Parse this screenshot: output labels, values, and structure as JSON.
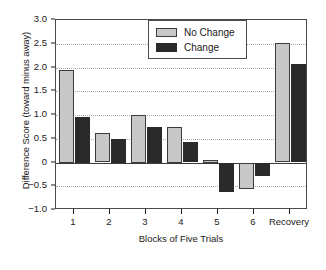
{
  "chart_data": {
    "type": "bar",
    "title": "",
    "xlabel": "Blocks of Five Trials",
    "ylabel": "Difference Score (toward minus away)",
    "categories": [
      "1",
      "2",
      "3",
      "4",
      "5",
      "6",
      "Recovery"
    ],
    "series": [
      {
        "name": "No Change",
        "color": "#c8c8c8",
        "values": [
          1.95,
          0.62,
          1.0,
          0.75,
          0.05,
          -0.55,
          2.52
        ]
      },
      {
        "name": "Change",
        "color": "#2a2a2a",
        "values": [
          0.95,
          0.5,
          0.75,
          0.44,
          -0.62,
          -0.28,
          2.07
        ]
      }
    ],
    "ylim": [
      -1.0,
      3.0
    ],
    "ytick_values": [
      3.0,
      2.5,
      2.0,
      1.5,
      1.0,
      0.5,
      0,
      -0.5,
      -1.0
    ],
    "ytick_labels": [
      "3.0",
      "2.5",
      "2.0",
      "1.5",
      "1.0",
      "0.5",
      "0",
      "−0.5",
      "−1.0"
    ],
    "grid": true,
    "grid_style": "dotted",
    "legend_position": "top-center"
  },
  "legend": {
    "entries": [
      {
        "label": "No Change",
        "swatch_class": "nochange"
      },
      {
        "label": "Change",
        "swatch_class": "change"
      }
    ]
  }
}
